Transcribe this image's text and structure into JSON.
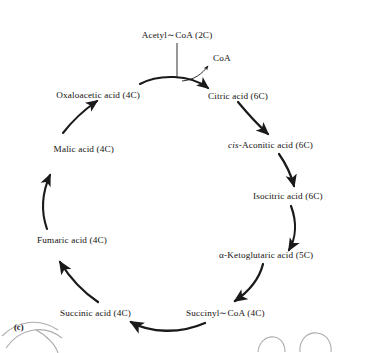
{
  "figure": {
    "label": "(c)",
    "title_hidden": "",
    "type": "krebs-cycle-diagram"
  },
  "nodes": {
    "acetyl_coa": "Acetyl∼CoA (2C)",
    "coa": "CoA",
    "oxaloacetic": "Oxaloacetic acid (4C)",
    "citric": "Citric acid (6C)",
    "cis_prefix": "cis-",
    "aconitic": "Aconitic acid (6C)",
    "isocitric": "Isocitric acid (6C)",
    "ketoglutaric": "α-Ketoglutaric acid (5C)",
    "succinyl_coa": "Succinyl∼CoA (4C)",
    "succinic": "Succinic acid (4C)",
    "fumaric": "Fumaric acid (4C)",
    "malic": "Malic acid (4C)"
  },
  "colors": {
    "ink": "#14120f",
    "stroke": "#1a1a1a",
    "background": "#ffffff"
  }
}
